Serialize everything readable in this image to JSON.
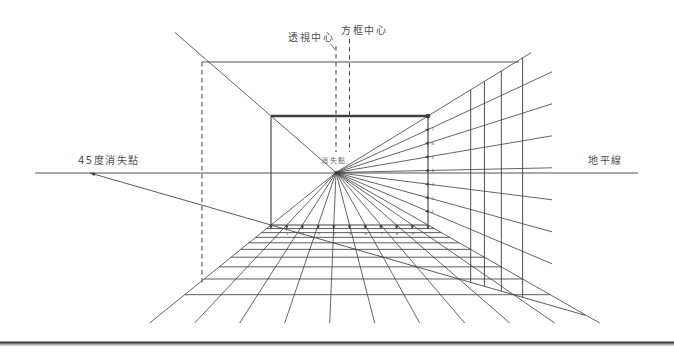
{
  "labels": {
    "perspective_center": "透視中心",
    "box_center": "方框中心",
    "vp45": "45度消失點",
    "horizon": "地平線",
    "vp": "消失點"
  },
  "numbers": {
    "right_ticks": [
      "1",
      "2",
      "3",
      "4",
      "5",
      "6",
      "7"
    ],
    "bottom_ticks": [
      "1",
      "2",
      "3",
      "4",
      "5",
      "6",
      "7",
      "8",
      "9"
    ]
  },
  "colors": {
    "ink": "#3e3e3e",
    "ink_light": "#5a5a5a",
    "label": "#4f4f4f",
    "vp_label": "#6a6a6a",
    "background": "#ffffff",
    "bottom_bar_dark": "#3d3d3d",
    "bottom_bar_light": "#8a8a8a"
  },
  "geometry": {
    "canvas": {
      "w": 674,
      "h": 355
    },
    "horizon": {
      "y": 173,
      "x1": 35,
      "x2": 638
    },
    "vp": {
      "x": 336,
      "y": 172.5
    },
    "vp45": {
      "x": 90,
      "y": 173
    },
    "box": {
      "x1": 271,
      "y1": 116,
      "x2": 428,
      "y2": 225
    },
    "outer_top": {
      "y": 62,
      "x1": 202,
      "x2": 519
    },
    "dashed_left": {
      "x": 202,
      "y1": 62,
      "y2": 283.5
    },
    "dashed_pc": {
      "x": 336,
      "y1": 46,
      "y2": 152
    },
    "dashed_bc": {
      "x": 349.5,
      "y1": 39,
      "y2": 152
    },
    "leader_pc": {
      "x1": 330.5,
      "y1": 44,
      "x2": 335.5,
      "y2": 50
    },
    "bottom_tick_count": 11,
    "right_tick_count": 8,
    "ray_bottom_end_y": 323,
    "ray_right_end_x": 552,
    "tl_ray_end_x": 175,
    "tr_ray_end_x": 531,
    "diag45_end_x": 585,
    "transversal_indices": [
      1,
      2,
      3,
      4,
      5,
      6,
      7,
      8,
      9
    ],
    "wall_vertical_indices": [
      5,
      6,
      7,
      8
    ],
    "bottom_bar": {
      "y1": 341.5,
      "h1": 2.2,
      "y2": 344.3,
      "h2": 1.1
    },
    "label_pos": {
      "perspective_center": {
        "x": 334,
        "y": 41,
        "anchor": "end",
        "size": 10
      },
      "box_center": {
        "x": 341,
        "y": 34,
        "anchor": "start",
        "size": 10
      },
      "vp45": {
        "x": 78,
        "y": 164,
        "anchor": "start",
        "size": 10
      },
      "horizon": {
        "x": 588,
        "y": 164,
        "anchor": "start",
        "size": 10
      },
      "vp": {
        "x": 321,
        "y": 163,
        "anchor": "start",
        "size": 7
      }
    }
  }
}
